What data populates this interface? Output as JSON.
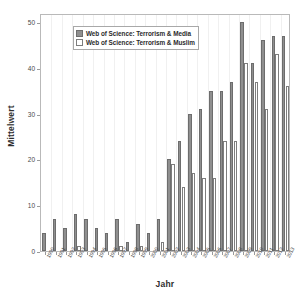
{
  "chart_data": {
    "type": "bar",
    "title": "",
    "xlabel": "Jahr",
    "ylabel": "Mittelwert",
    "ylim": [
      0,
      52
    ],
    "yticks": [
      0,
      10,
      20,
      30,
      40,
      50
    ],
    "grid": false,
    "legend_position": "top-center-inside",
    "categories": [
      "1990",
      "1991",
      "1992",
      "1993",
      "1994",
      "1995",
      "1996",
      "1997",
      "1998",
      "1999",
      "2000",
      "2001",
      "2002",
      "2003",
      "2004",
      "2005",
      "2006",
      "2007",
      "2008",
      "2009",
      "2010",
      "2011",
      "2012",
      "2013"
    ],
    "series": [
      {
        "name": "Web of Science: Terrorism & Media",
        "color": "#8f8f8f",
        "values": [
          4,
          7,
          5,
          8,
          7,
          5,
          4,
          7,
          2,
          6,
          4,
          7,
          20,
          24,
          30,
          31,
          35,
          35,
          37,
          50,
          41,
          46,
          47,
          47
        ]
      },
      {
        "name": "Web of Science: Terrorism & Muslim",
        "color": "#ffffff",
        "values": [
          0,
          0,
          0,
          1,
          0,
          0,
          0,
          1,
          0,
          1,
          0,
          2,
          19,
          14,
          17,
          16,
          16,
          24,
          24,
          41,
          37,
          31,
          43,
          36
        ]
      }
    ]
  },
  "legend": {
    "items": [
      {
        "label": "Web of Science: Terrorism & Media"
      },
      {
        "label": "Web of Science: Terrorism & Muslim"
      }
    ]
  }
}
